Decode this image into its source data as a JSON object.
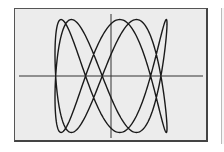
{
  "chart_data": {
    "type": "line",
    "title": "",
    "xlabel": "",
    "ylabel": "",
    "parametric": {
      "x_expr": "sin(2t + pi/4)",
      "y_expr": "sin(5t)",
      "x_frequency": 2,
      "y_frequency": 5,
      "phase": 0.785,
      "t_range": [
        0,
        6.2832
      ],
      "samples": 600
    },
    "xlim": [
      -1.55,
      1.55
    ],
    "ylim": [
      -1.1,
      1.1
    ],
    "axes": {
      "x_axis_visible": true,
      "y_axis_visible": true,
      "ticks": false
    },
    "grid": false,
    "legend": null
  },
  "colors": {
    "screen_background": "#ececec",
    "curve": "#1a1a1a",
    "axes": "#333333",
    "frame": "#555555"
  }
}
